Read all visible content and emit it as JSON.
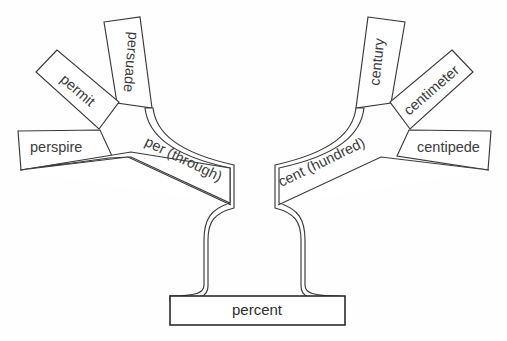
{
  "diagram": {
    "type": "word-root-tree",
    "background_color": "#fefefe",
    "line_color": "#3a3a3a",
    "text_color": "#3b3b3b",
    "root": {
      "label": "percent"
    },
    "stems": [
      {
        "id": "per",
        "label": "per (through)",
        "side": "left",
        "branches": [
          {
            "id": "perspire",
            "label": "perspire"
          },
          {
            "id": "permit",
            "label": "permit"
          },
          {
            "id": "persuade",
            "label": "persuade"
          }
        ]
      },
      {
        "id": "cent",
        "label": "cent (hundred)",
        "side": "right",
        "branches": [
          {
            "id": "century",
            "label": "century"
          },
          {
            "id": "centimeter",
            "label": "centimeter"
          },
          {
            "id": "centipede",
            "label": "centipede"
          }
        ]
      }
    ]
  }
}
